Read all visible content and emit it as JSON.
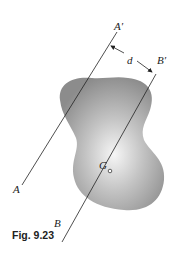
{
  "figure": {
    "caption": "Fig. 9.23",
    "labels": {
      "axis_a_top": "A′",
      "axis_a_bottom": "A",
      "axis_b_top": "B′",
      "axis_b_bottom": "B",
      "distance": "d",
      "centroid": "G"
    },
    "colors": {
      "shape_dark": "#8a8a8a",
      "shape_light": "#f4f4f4",
      "line": "#222222"
    }
  }
}
